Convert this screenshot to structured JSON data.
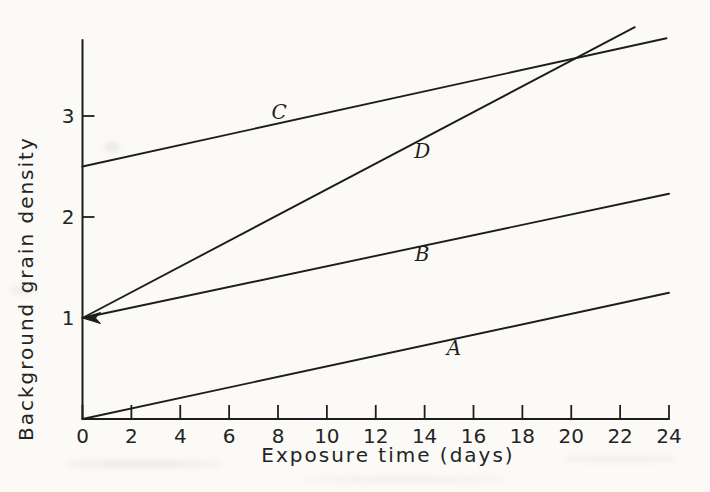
{
  "figure": {
    "paper_color": "#fbfaf7",
    "ink_color": "#1d1d1d"
  },
  "chart_data": {
    "type": "line",
    "title": "",
    "xlabel": "Exposure time (days)",
    "ylabel": "Background grain density",
    "xlim": [
      0,
      24
    ],
    "ylim": [
      0,
      3.75
    ],
    "x_ticks": [
      0,
      2,
      4,
      6,
      8,
      10,
      12,
      14,
      16,
      18,
      20,
      22,
      24
    ],
    "y_ticks": [
      1,
      2,
      3
    ],
    "grid": false,
    "legend_position": "inline-labels",
    "series": [
      {
        "name": "A",
        "points": [
          [
            0,
            0
          ],
          [
            24,
            1.25
          ]
        ],
        "label_pos": [
          15.2,
          0.7
        ]
      },
      {
        "name": "B",
        "points": [
          [
            0,
            1
          ],
          [
            24,
            2.23
          ]
        ],
        "label_pos": [
          13.9,
          1.63
        ]
      },
      {
        "name": "C",
        "points": [
          [
            0,
            2.5
          ],
          [
            23.9,
            3.77
          ]
        ],
        "label_pos": [
          8.05,
          3.04
        ]
      },
      {
        "name": "D",
        "points": [
          [
            0,
            1
          ],
          [
            22.6,
            3.88
          ]
        ],
        "label_pos": [
          13.9,
          2.65
        ]
      }
    ],
    "annotations": [
      {
        "type": "arrowhead",
        "at": [
          0,
          1
        ],
        "direction": "left"
      }
    ]
  }
}
